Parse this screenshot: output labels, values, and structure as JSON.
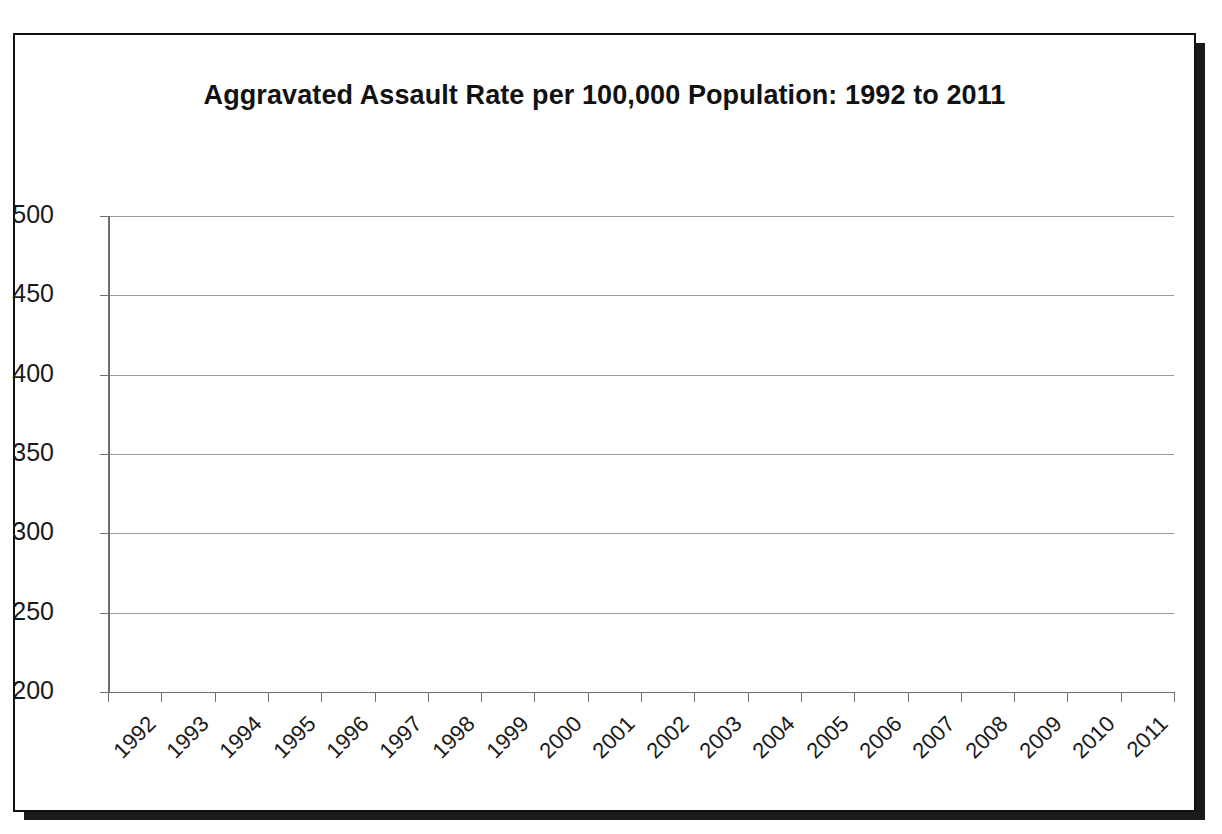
{
  "chart_data": {
    "type": "line",
    "title": "Aggravated Assault Rate per 100,000 Population: 1992 to 2011",
    "xlabel": "",
    "ylabel": "",
    "categories": [
      "1992",
      "1993",
      "1994",
      "1995",
      "1996",
      "1997",
      "1998",
      "1999",
      "2000",
      "2001",
      "2002",
      "2003",
      "2004",
      "2005",
      "2006",
      "2007",
      "2008",
      "2009",
      "2010",
      "2011"
    ],
    "values": [
      441,
      440,
      428,
      418,
      391,
      382,
      361,
      334,
      324,
      319,
      309,
      295,
      288,
      290,
      291,
      286,
      276,
      264,
      251,
      240
    ],
    "series": [
      {
        "name": "Aggravated Assault Rate per 100,000 Population",
        "values": [
          441,
          440,
          428,
          418,
          391,
          382,
          361,
          334,
          324,
          319,
          309,
          295,
          288,
          290,
          291,
          286,
          276,
          264,
          251,
          240
        ]
      }
    ],
    "ylim": [
      200,
      500
    ],
    "y_ticks": [
      500,
      450,
      400,
      350,
      300,
      250,
      200
    ],
    "y_tick_labels": [
      "500",
      "450",
      "400",
      "350",
      "300",
      "250",
      "200"
    ],
    "x_tick_labels": [
      "1992",
      "1993",
      "1994",
      "1995",
      "1996",
      "1997",
      "1998",
      "1999",
      "2000",
      "2001",
      "2002",
      "2003",
      "2004",
      "2005",
      "2006",
      "2007",
      "2008",
      "2009",
      "2010",
      "2011"
    ],
    "x_tick_rotation": -45,
    "grid": true,
    "grid_axis": "y",
    "legend": false,
    "legend_position": "none",
    "marker": "diamond",
    "line_color": "#1a1a1a",
    "marker_color": "#101010",
    "grid_color": "#9a9a9a",
    "background_color": "#ffffff",
    "frame": true
  },
  "figure": {
    "border_color": "#101010",
    "shadow_color": "#1b1b1b"
  }
}
